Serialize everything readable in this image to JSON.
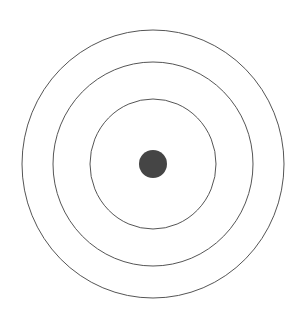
{
  "diagram": {
    "type": "concentric-circles",
    "center": {
      "x": 153,
      "y": 164
    },
    "stroke_color": "#555555",
    "dot_color": "#454545",
    "rings": [
      {
        "name": "outer-ring",
        "rx": 131,
        "ry": 134
      },
      {
        "name": "middle-ring",
        "rx": 100,
        "ry": 102
      },
      {
        "name": "inner-ring",
        "rx": 63,
        "ry": 65
      }
    ],
    "center_dot": {
      "r": 14
    }
  }
}
